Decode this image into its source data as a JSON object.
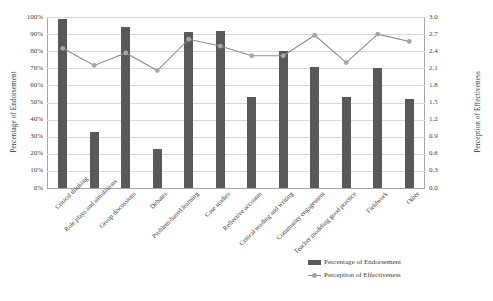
{
  "chart_data": {
    "type": "bar",
    "title": "",
    "xlabel": "",
    "ylabel": "Percentage of Endorsement",
    "y2label": "Perception of Effectiveness",
    "ylim": [
      0,
      100
    ],
    "y2lim": [
      0.0,
      3.0
    ],
    "grid": true,
    "legend_position": "bottom-right",
    "categories": [
      "Critical thinking",
      "Role plays and simulations",
      "Group discussions",
      "Debates",
      "Problem-based learning",
      "Case studies",
      "Reflective accounts",
      "Critical reading and writing",
      "Community engagement",
      "Teacher modeling good practice",
      "Fieldwork",
      "Other"
    ],
    "series": [
      {
        "name": "Percentage of Endorsement",
        "type": "bar",
        "axis": "left",
        "color": "#595959",
        "values": [
          99,
          33,
          94,
          23,
          91,
          92,
          53,
          80,
          71,
          53,
          70,
          52
        ]
      },
      {
        "name": "Perception of Effectiveness",
        "type": "line",
        "axis": "right",
        "color": "#8c8c8c",
        "marker_color": "#a6a6a6",
        "values": [
          2.45,
          2.15,
          2.37,
          2.06,
          2.61,
          2.49,
          2.32,
          2.32,
          2.68,
          2.2,
          2.7,
          2.57
        ]
      }
    ],
    "yticks": [
      "0%",
      "10%",
      "20%",
      "30%",
      "40%",
      "50%",
      "60%",
      "70%",
      "80%",
      "90%",
      "100%"
    ],
    "ytick_values": [
      0,
      10,
      20,
      30,
      40,
      50,
      60,
      70,
      80,
      90,
      100
    ],
    "y2ticks": [
      "0.0",
      "0.3",
      "0.6",
      "0.9",
      "1.2",
      "1.5",
      "1.8",
      "2.1",
      "2.4",
      "2.7",
      "3.0"
    ],
    "y2tick_values": [
      0.0,
      0.3,
      0.6,
      0.9,
      1.2,
      1.5,
      1.8,
      2.1,
      2.4,
      2.7,
      3.0
    ]
  },
  "legend": {
    "items": [
      {
        "label": "Percentage of Endorsement",
        "marker": "bar-swatch"
      },
      {
        "label": "Perception of Effectiveness",
        "marker": "line-marker-swatch"
      }
    ]
  },
  "colors": {
    "bar": "#595959",
    "line": "#8c8c8c",
    "marker": "#a6a6a6",
    "grid": "#d9d9d9",
    "axis": "#a6a6a6",
    "text": "#404040",
    "background": "#ffffff"
  }
}
